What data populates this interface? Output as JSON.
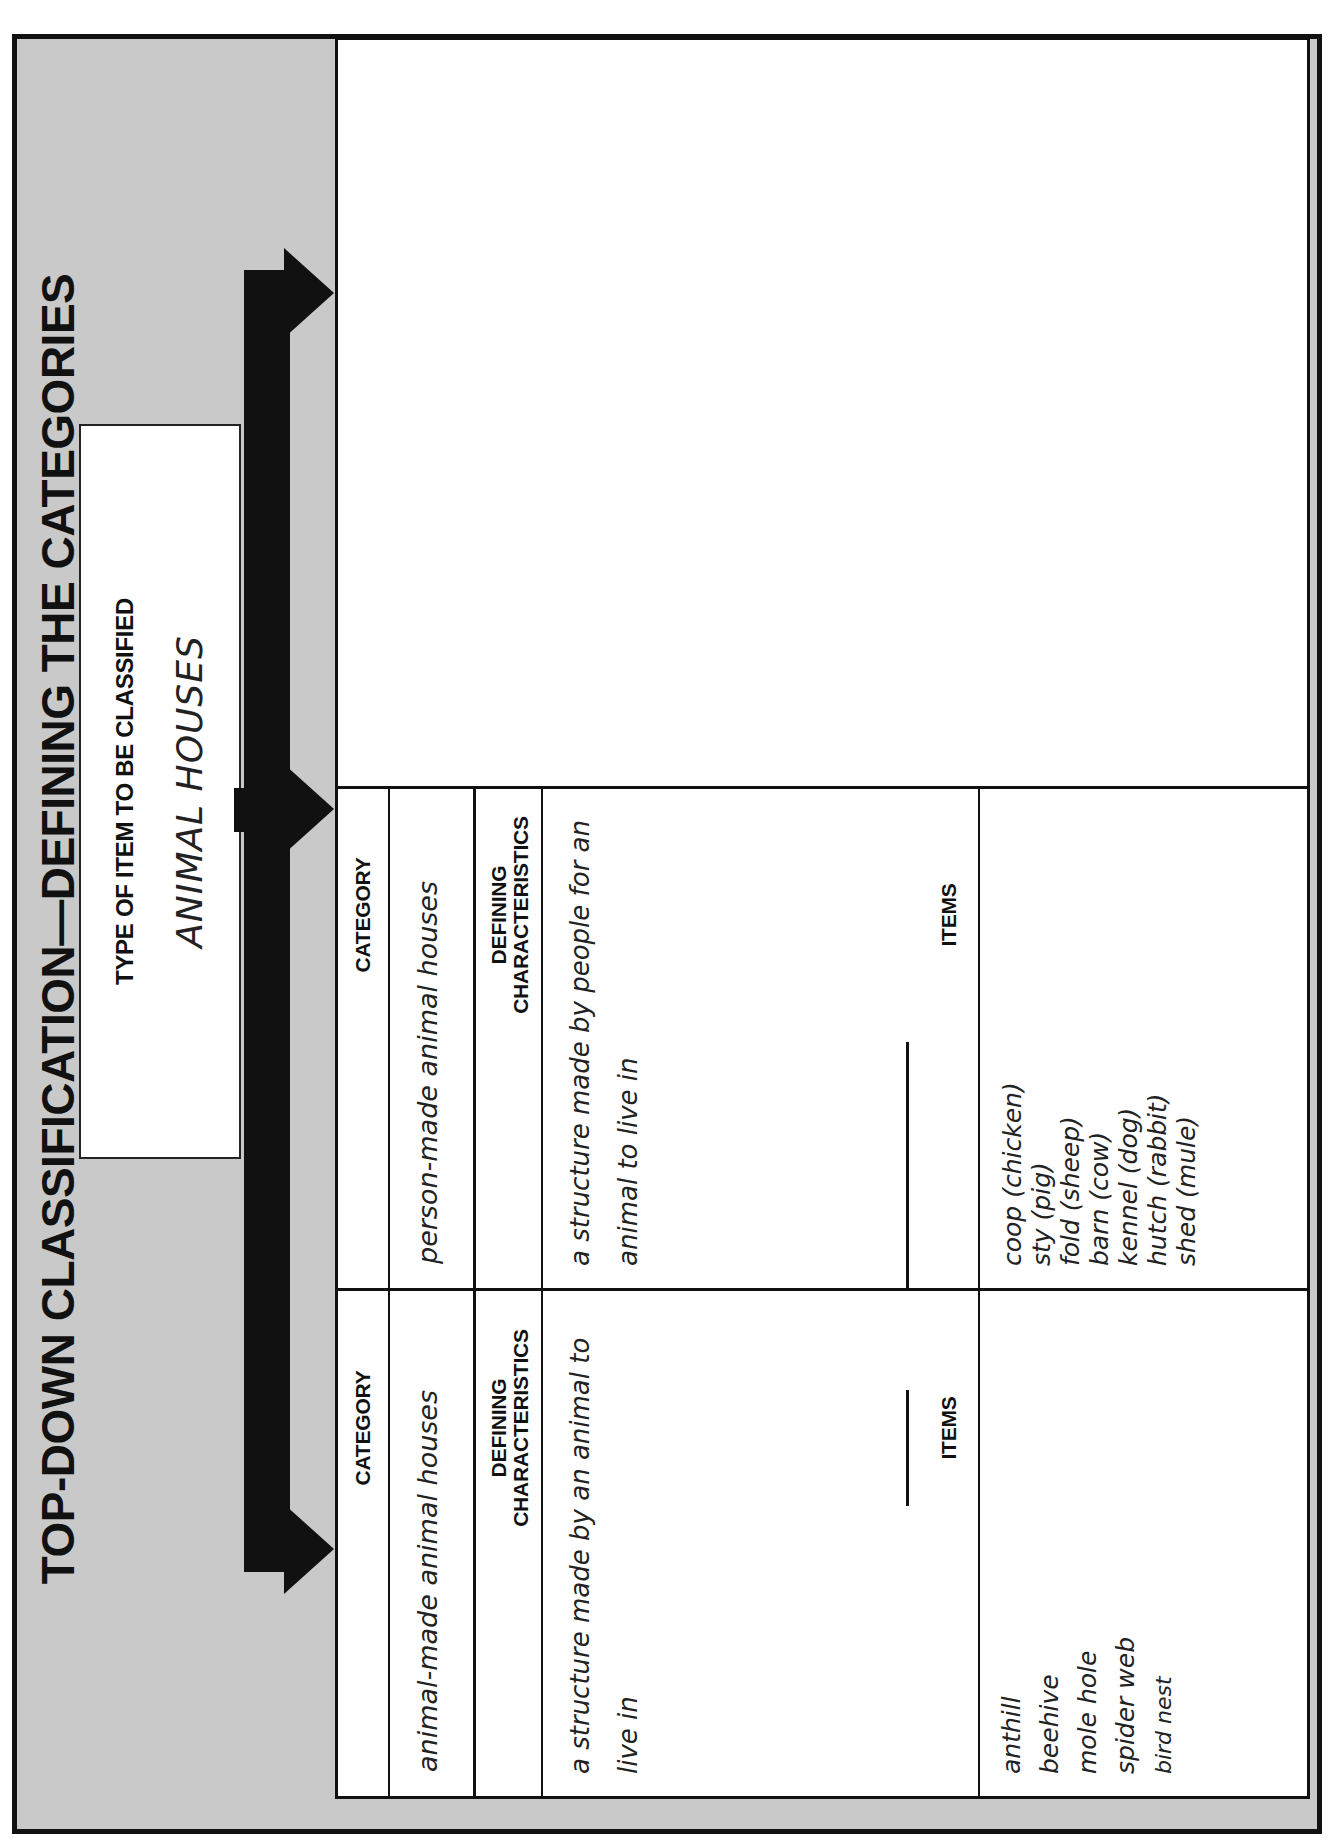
{
  "document": {
    "title": "TOP-DOWN CLASSIFICATION—DEFINING THE CATEGORIES",
    "orientation": "rotated 90 degrees counter-clockwise",
    "type_box": {
      "label": "TYPE OF ITEM TO BE CLASSIFIED",
      "value": "ANIMAL HOUSES"
    },
    "arrows": {
      "icon": "branching-arrow-icon",
      "count": 3,
      "color": "#111111"
    },
    "colors": {
      "frame_background": "#c9c9c9",
      "panel_background": "#ffffff",
      "line": "#111111"
    },
    "panels": [
      {
        "category_label": "CATEGORY",
        "category_value": "animal-made animal houses",
        "defining_label_line1": "DEFINING",
        "defining_label_line2": "CHARACTERISTICS",
        "defining_value_line1": "a structure made by an animal to",
        "defining_value_line2": "live in",
        "items_label": "ITEMS",
        "items": [
          "anthill",
          "beehive",
          "mole hole",
          "spider web",
          "bird nest"
        ]
      },
      {
        "category_label": "CATEGORY",
        "category_value": "person-made animal houses",
        "defining_label_line1": "DEFINING",
        "defining_label_line2": "CHARACTERISTICS",
        "defining_value_line1": "a structure made by people for an",
        "defining_value_line2": "animal to live in",
        "items_label": "ITEMS",
        "items": [
          "coop (chicken)",
          "sty (pig)",
          "fold (sheep)",
          "barn (cow)",
          "kennel (dog)",
          "hutch (rabbit)",
          "shed (mule)"
        ]
      },
      {
        "category_label": "CATEGORY",
        "category_value": "nature-made animal houses",
        "defining_label_line1": "DEFINING",
        "defining_label_line2": "CHARACTERISTICS",
        "defining_value_line1": "a place in nature where an animal",
        "defining_value_line2": "lives",
        "items_label": "ITEMS",
        "items": [
          "puddle (mosquito)",
          "ocean (whales)",
          "pouch (kangaroo)",
          "tree (monkeys)",
          "river (hippos)",
          "shell (turtle)"
        ]
      }
    ]
  }
}
